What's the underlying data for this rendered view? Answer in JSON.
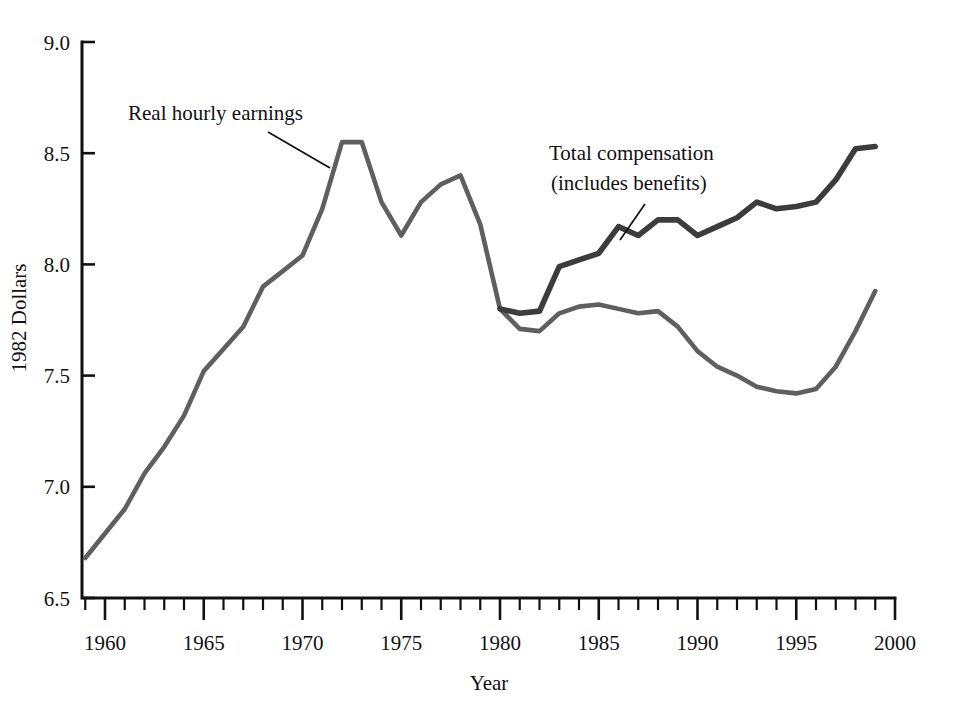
{
  "chart_data": {
    "type": "line",
    "title": "",
    "subtitle": "",
    "xlabel": "Year",
    "ylabel": "1982 Dollars",
    "xlim": [
      1959,
      2000
    ],
    "ylim": [
      6.5,
      9.0
    ],
    "grid": false,
    "legend_position": "inline-annotations",
    "x_major_ticks": [
      1960,
      1965,
      1970,
      1975,
      1980,
      1985,
      1990,
      1995,
      2000
    ],
    "x_major_tick_labels": [
      "1960",
      "1965",
      "1970",
      "1975",
      "1980",
      "1985",
      "1990",
      "1995",
      "2000"
    ],
    "x_minor_tick_step": 1,
    "y_ticks": [
      6.5,
      7.0,
      7.5,
      8.0,
      8.5,
      9.0
    ],
    "y_tick_labels": [
      "6.5",
      "7.0",
      "7.5",
      "8.0",
      "8.5",
      "9.0"
    ],
    "series": [
      {
        "name": "Real hourly earnings",
        "color": "#5f5f5f",
        "line_width": 4.6,
        "x": [
          1959,
          1960,
          1961,
          1962,
          1963,
          1964,
          1965,
          1966,
          1967,
          1968,
          1969,
          1970,
          1971,
          1972,
          1973,
          1974,
          1975,
          1976,
          1977,
          1978,
          1979,
          1980,
          1981,
          1982,
          1983,
          1984,
          1985,
          1986,
          1987,
          1988,
          1989,
          1990,
          1991,
          1992,
          1993,
          1994,
          1995,
          1996,
          1997,
          1998,
          1999
        ],
        "values": [
          6.68,
          6.79,
          6.9,
          7.06,
          7.18,
          7.32,
          7.52,
          7.62,
          7.72,
          7.9,
          7.97,
          8.04,
          8.25,
          8.55,
          8.55,
          8.28,
          8.13,
          8.28,
          8.36,
          8.4,
          8.18,
          7.8,
          7.71,
          7.7,
          7.78,
          7.81,
          7.82,
          7.8,
          7.78,
          7.79,
          7.72,
          7.61,
          7.54,
          7.5,
          7.45,
          7.43,
          7.42,
          7.44,
          7.54,
          7.7,
          7.88
        ]
      },
      {
        "name": "Total compensation (includes benefits)",
        "color": "#3c3c3c",
        "line_width": 5.6,
        "x": [
          1980,
          1981,
          1982,
          1983,
          1984,
          1985,
          1986,
          1987,
          1988,
          1989,
          1990,
          1991,
          1992,
          1993,
          1994,
          1995,
          1996,
          1997,
          1998,
          1999
        ],
        "values": [
          7.8,
          7.78,
          7.79,
          7.99,
          8.02,
          8.05,
          8.17,
          8.13,
          8.2,
          8.2,
          8.13,
          8.17,
          8.21,
          8.28,
          8.25,
          8.26,
          8.28,
          8.38,
          8.52,
          8.53
        ]
      }
    ],
    "annotations": [
      {
        "id": "real-hourly-earnings",
        "text": "Real hourly earnings",
        "text_x": 128,
        "text_y": 120,
        "leader_from": [
          268,
          132
        ],
        "leader_to": [
          330,
          168
        ]
      },
      {
        "id": "total-compensation",
        "text_line_1": "Total compensation",
        "text_line_2": "(includes benefits)",
        "text_x": 549,
        "text_y": 160,
        "text_y_2": 190,
        "leader_from": [
          645,
          204
        ],
        "leader_to": [
          620,
          240
        ]
      }
    ]
  },
  "axis": {
    "y_label": "1982 Dollars",
    "x_label": "Year"
  }
}
